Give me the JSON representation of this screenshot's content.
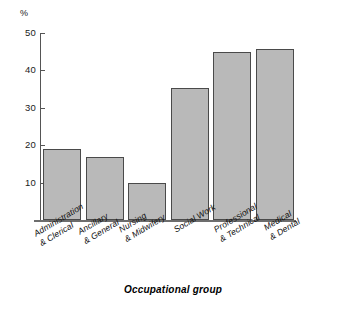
{
  "chart_data": {
    "type": "bar",
    "title": "",
    "subtitle": "",
    "xlabel": "Occupational group",
    "ylabel": "%",
    "ylim": [
      0,
      50
    ],
    "y_ticks": [
      10,
      20,
      30,
      40,
      50
    ],
    "grid": false,
    "legend": false,
    "categories": [
      "Administration & Clerical",
      "Ancillary & General",
      "Nursing & Midwifery",
      "Social Work",
      "Professional & Technical",
      "Medical & Dental"
    ],
    "values": [
      19,
      16.8,
      10,
      35.4,
      45,
      45.6
    ],
    "bar_fill_color": "#b9b9b9",
    "bar_border_color": "#4a4a4a",
    "axis_color": "#555555"
  },
  "axis": {
    "y_unit_label": "%",
    "tick_labels": [
      "50",
      "40",
      "30",
      "20",
      "10"
    ],
    "x_axis_title": "Occupational group"
  },
  "categories": [
    {
      "label": "Administration\n& Clerical"
    },
    {
      "label": "Ancillary\n& General"
    },
    {
      "label": "Nursing\n& Midwifery"
    },
    {
      "label": "Social Work"
    },
    {
      "label": "Professional\n& Technical"
    },
    {
      "label": "Medical\n& Dental"
    }
  ]
}
